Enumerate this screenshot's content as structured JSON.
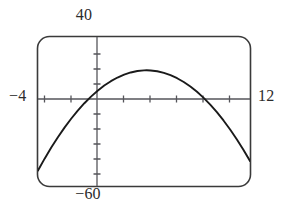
{
  "window": {
    "xmin_label": "−4",
    "xmax_label": "12",
    "ymin_label": "−60",
    "ymax_label": "40"
  },
  "chart_data": {
    "type": "line",
    "title": "",
    "subtitle": "",
    "xlabel": "",
    "ylabel": "",
    "grid": false,
    "legend": null,
    "xlim": [
      -4,
      12
    ],
    "ylim": [
      -60,
      40
    ],
    "x_tick_labels": [
      "-4",
      "-2",
      "0",
      "2",
      "4",
      "6",
      "8",
      "10",
      "12"
    ],
    "x_ticks": [
      -4,
      -2,
      0,
      2,
      4,
      6,
      8,
      10,
      12
    ],
    "y_tick_labels": [
      "-60",
      "-50",
      "-40",
      "-30",
      "-20",
      "-10",
      "0",
      "10",
      "20",
      "30",
      "40"
    ],
    "y_ticks": [
      -60,
      -50,
      -40,
      -30,
      -20,
      -10,
      0,
      10,
      20,
      30,
      40
    ],
    "x_tick_step": 2,
    "y_tick_step": 10,
    "series": [
      {
        "name": "parabola",
        "color": "#1a1a1a",
        "equation": "y = -x^2 + 8.4x",
        "x": [
          -4,
          -3.5,
          -3,
          -2.5,
          -2,
          -1.5,
          -1,
          -0.5,
          0,
          0.5,
          1,
          1.5,
          2,
          2.5,
          3,
          3.5,
          4,
          4.2,
          4.5,
          5,
          5.5,
          6,
          6.5,
          7,
          7.5,
          8,
          8.4,
          8.5,
          9,
          9.5,
          10,
          10.5,
          11,
          11.5,
          12
        ],
        "values": [
          -49.6,
          -41.65,
          -34.2,
          -27.25,
          -20.8,
          -14.85,
          -9.4,
          -4.45,
          0,
          3.95,
          7.4,
          10.35,
          12.8,
          14.75,
          16.2,
          17.15,
          17.6,
          17.64,
          17.55,
          17,
          15.95,
          14.4,
          12.35,
          9.8,
          6.75,
          3.2,
          0,
          -0.85,
          -5.4,
          -10.45,
          -16,
          -22.05,
          -28.6,
          -35.65,
          -43.2
        ]
      }
    ],
    "x_intercepts": [
      0,
      8.4
    ],
    "vertex": [
      4.2,
      17.6
    ]
  }
}
